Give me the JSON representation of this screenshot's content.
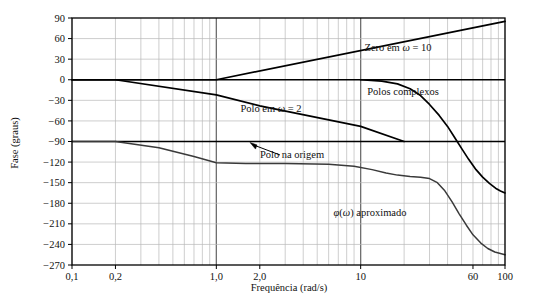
{
  "chart_data": {
    "type": "line",
    "title": "",
    "xlabel": "Frequência (rad/s)",
    "ylabel": "Fase (graus)",
    "xscale": "log",
    "xlim": [
      0.1,
      100
    ],
    "ylim": [
      -270,
      90
    ],
    "grid": true,
    "legend_position": "inline-annotations",
    "xticks": [
      {
        "value": 0.1,
        "label": "0,1"
      },
      {
        "value": 0.2,
        "label": "0,2"
      },
      {
        "value": 1.0,
        "label": "1,0"
      },
      {
        "value": 2.0,
        "label": "2,0"
      },
      {
        "value": 10,
        "label": "10"
      },
      {
        "value": 60,
        "label": "60"
      },
      {
        "value": 100,
        "label": "100"
      }
    ],
    "yticks": [
      {
        "value": 90,
        "label": "90"
      },
      {
        "value": 60,
        "label": "60"
      },
      {
        "value": 30,
        "label": "30"
      },
      {
        "value": 0,
        "label": "0"
      },
      {
        "value": -30,
        "label": "−30"
      },
      {
        "value": -60,
        "label": "−60"
      },
      {
        "value": -90,
        "label": "−90"
      },
      {
        "value": -120,
        "label": "−120"
      },
      {
        "value": -150,
        "label": "−150"
      },
      {
        "value": -180,
        "label": "−180"
      },
      {
        "value": -210,
        "label": "−210"
      },
      {
        "value": -240,
        "label": "−240"
      },
      {
        "value": -270,
        "label": "−270"
      }
    ],
    "series": [
      {
        "name": "Zero em ω = 10",
        "label": "Zero em ω = 10",
        "points": [
          [
            0.1,
            0
          ],
          [
            0.2,
            0
          ],
          [
            1.0,
            0
          ],
          [
            100,
            85
          ]
        ]
      },
      {
        "name": "Polo em ω = 2",
        "label": "Polo em ω = 2",
        "points": [
          [
            0.1,
            0
          ],
          [
            0.2,
            0
          ],
          [
            1.0,
            -22
          ],
          [
            2.0,
            -38
          ],
          [
            10,
            -68
          ],
          [
            20,
            -90
          ]
        ]
      },
      {
        "name": "Polo na origem",
        "label": "Polo na origem",
        "points": [
          [
            0.1,
            -90
          ],
          [
            100,
            -90
          ]
        ]
      },
      {
        "name": "Polos complexos",
        "label": "Polos complexos",
        "points": [
          [
            10,
            0
          ],
          [
            14,
            -2
          ],
          [
            18,
            -6
          ],
          [
            22,
            -13
          ],
          [
            26,
            -23
          ],
          [
            30,
            -36
          ],
          [
            35,
            -52
          ],
          [
            40,
            -68
          ],
          [
            45,
            -85
          ],
          [
            50,
            -100
          ],
          [
            56,
            -116
          ],
          [
            63,
            -131
          ],
          [
            70,
            -142
          ],
          [
            78,
            -151
          ],
          [
            86,
            -158
          ],
          [
            93,
            -162
          ],
          [
            100,
            -165
          ]
        ]
      },
      {
        "name": "φ(ω) aproximado",
        "label": "φ(ω) aproximado",
        "points": [
          [
            0.1,
            -90
          ],
          [
            0.2,
            -90
          ],
          [
            0.4,
            -99
          ],
          [
            0.7,
            -112
          ],
          [
            1.0,
            -121
          ],
          [
            1.6,
            -122
          ],
          [
            3,
            -122
          ],
          [
            6,
            -123
          ],
          [
            9,
            -126
          ],
          [
            12,
            -131
          ],
          [
            15,
            -136
          ],
          [
            18,
            -139
          ],
          [
            22,
            -141
          ],
          [
            26,
            -142
          ],
          [
            30,
            -144
          ],
          [
            34,
            -150
          ],
          [
            38,
            -161
          ],
          [
            43,
            -178
          ],
          [
            48,
            -195
          ],
          [
            54,
            -212
          ],
          [
            60,
            -226
          ],
          [
            68,
            -238
          ],
          [
            76,
            -246
          ],
          [
            85,
            -251
          ],
          [
            100,
            -255
          ]
        ]
      }
    ],
    "annotations": [
      {
        "name": "zero-label",
        "text": "Zero em ω = 10",
        "x": 398,
        "y": 51
      },
      {
        "name": "complex-poles-label",
        "text": "Polos complexos",
        "x": 403,
        "y": 95
      },
      {
        "name": "pole-w2-label",
        "text": "Polo em ω = 2",
        "x": 271,
        "y": 112
      },
      {
        "name": "pole-origin-label",
        "text": "Polo na origem",
        "x": 292,
        "y": 158
      },
      {
        "name": "phi-approx-label",
        "text": "φ(ω) aproximado",
        "x": 370,
        "y": 216
      }
    ],
    "colors": {
      "background": "#ffffff",
      "plot_line": "#000000",
      "approx_line": "#3a3a3a",
      "grid_minor": "#b9b9b9",
      "grid_major": "#6e6e6e",
      "axis": "#000000",
      "text": "#111111"
    }
  }
}
